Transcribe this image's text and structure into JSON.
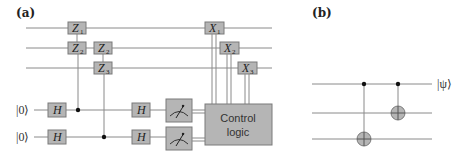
{
  "panel_a": {
    "label": "(a)",
    "z_gates": [
      {
        "name": "Z",
        "sub": "1"
      },
      {
        "name": "Z",
        "sub": "2"
      },
      {
        "name": "Z",
        "sub": "2"
      },
      {
        "name": "Z",
        "sub": "3"
      }
    ],
    "x_gates": [
      {
        "name": "X",
        "sub": "1"
      },
      {
        "name": "X",
        "sub": "2"
      },
      {
        "name": "X",
        "sub": "3"
      }
    ],
    "ancilla_inputs": [
      "|0⟩",
      "|0⟩"
    ],
    "h_gate": "H",
    "control_logic": [
      "Control",
      "logic"
    ]
  },
  "panel_b": {
    "label": "(b)",
    "output_state": "|ψ⟩"
  },
  "colors": {
    "gate_fill": "#b5b5b5",
    "wire": "#8a8a8a",
    "dot": "#111111"
  }
}
